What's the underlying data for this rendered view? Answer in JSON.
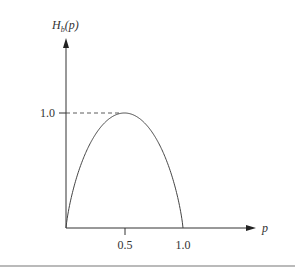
{
  "chart_data": {
    "type": "line",
    "title": "",
    "xlabel": "p",
    "ylabel": "H_b(p)",
    "ylabel_main": "H",
    "ylabel_sub": "b",
    "ylabel_arg": "(p)",
    "x_ticks": [
      "0.5",
      "1.0"
    ],
    "y_ticks": [
      "1.0"
    ],
    "xlim": [
      0,
      1.0
    ],
    "ylim": [
      0,
      1.0
    ],
    "grid": false,
    "legend": null,
    "annotations": [
      "dashed line from y-axis at 1.0 to curve maximum at p=0.5"
    ],
    "series": [
      {
        "name": "binary entropy H_b(p)",
        "x": [
          0,
          0.05,
          0.1,
          0.2,
          0.3,
          0.4,
          0.5,
          0.6,
          0.7,
          0.8,
          0.9,
          0.95,
          1.0
        ],
        "values": [
          0,
          0.286,
          0.469,
          0.722,
          0.881,
          0.971,
          1.0,
          0.971,
          0.881,
          0.722,
          0.469,
          0.286,
          0
        ]
      }
    ]
  }
}
